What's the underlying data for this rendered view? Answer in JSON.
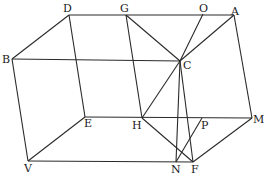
{
  "diagram": {
    "points": {
      "D": {
        "x": 69,
        "y": 15,
        "lx": 63,
        "ly": 12
      },
      "G": {
        "x": 126,
        "y": 15,
        "lx": 120,
        "ly": 12
      },
      "O": {
        "x": 203,
        "y": 14,
        "lx": 199,
        "ly": 12
      },
      "A": {
        "x": 234,
        "y": 15,
        "lx": 231,
        "ly": 15
      },
      "B": {
        "x": 12,
        "y": 59,
        "lx": 2,
        "ly": 63
      },
      "C": {
        "x": 180,
        "y": 61,
        "lx": 183,
        "ly": 69
      },
      "E": {
        "x": 85,
        "y": 117,
        "lx": 84,
        "ly": 127
      },
      "H": {
        "x": 142,
        "y": 118,
        "lx": 132,
        "ly": 129
      },
      "P": {
        "x": 202,
        "y": 118,
        "lx": 201,
        "ly": 129
      },
      "M": {
        "x": 252,
        "y": 118,
        "lx": 253,
        "ly": 123
      },
      "V": {
        "x": 28,
        "y": 161,
        "lx": 24,
        "ly": 172
      },
      "N": {
        "x": 176,
        "y": 162,
        "lx": 171,
        "ly": 173
      },
      "F": {
        "x": 193,
        "y": 162,
        "lx": 191,
        "ly": 173
      }
    },
    "segments": [
      [
        "D",
        "A"
      ],
      [
        "B",
        "D"
      ],
      [
        "B",
        "C"
      ],
      [
        "D",
        "E"
      ],
      [
        "B",
        "V"
      ],
      [
        "V",
        "E"
      ],
      [
        "E",
        "M"
      ],
      [
        "V",
        "F"
      ],
      [
        "G",
        "H"
      ],
      [
        "G",
        "C"
      ],
      [
        "C",
        "O"
      ],
      [
        "C",
        "A"
      ],
      [
        "C",
        "H"
      ],
      [
        "C",
        "N"
      ],
      [
        "C",
        "F"
      ],
      [
        "A",
        "M"
      ],
      [
        "H",
        "F"
      ],
      [
        "N",
        "P"
      ],
      [
        "F",
        "M"
      ]
    ],
    "labels": [
      "D",
      "G",
      "O",
      "A",
      "B",
      "C",
      "E",
      "H",
      "P",
      "M",
      "V",
      "N",
      "F"
    ]
  }
}
